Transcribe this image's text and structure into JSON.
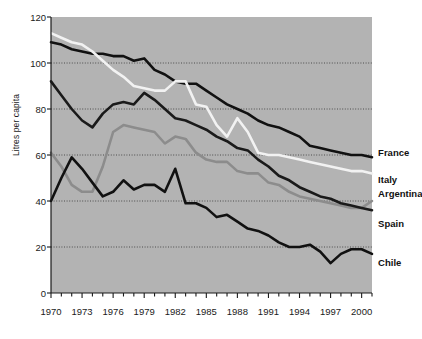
{
  "chart_data": {
    "type": "line",
    "title": "",
    "xlabel": "",
    "ylabel": "Litres per capita",
    "xlim": [
      1970,
      2001
    ],
    "ylim": [
      0,
      120
    ],
    "grid": true,
    "grid_values": [
      20,
      40,
      60,
      80,
      100
    ],
    "legend_position": "right-inline-labels",
    "plot_background": "#b3b3b3",
    "x": [
      1970,
      1971,
      1972,
      1973,
      1974,
      1975,
      1976,
      1977,
      1978,
      1979,
      1980,
      1981,
      1982,
      1983,
      1984,
      1985,
      1986,
      1987,
      1988,
      1989,
      1990,
      1991,
      1992,
      1993,
      1994,
      1995,
      1996,
      1997,
      1998,
      1999,
      2000,
      2001
    ],
    "xtick_labels": [
      "1970",
      "1973",
      "1976",
      "1979",
      "1982",
      "1985",
      "1988",
      "1991",
      "1994",
      "1997",
      "2000"
    ],
    "xtick_values": [
      1970,
      1973,
      1976,
      1979,
      1982,
      1985,
      1988,
      1991,
      1994,
      1997,
      2000
    ],
    "ytick_labels": [
      "0",
      "20",
      "40",
      "60",
      "80",
      "100",
      "120"
    ],
    "ytick_values": [
      0,
      20,
      40,
      60,
      80,
      100,
      120
    ],
    "series": [
      {
        "name": "France",
        "color": "#111111",
        "width": 2.6,
        "label_x": 2001.3,
        "label_y": 61,
        "values": [
          109,
          108,
          106,
          105,
          104,
          104,
          103,
          103,
          101,
          102,
          97,
          95,
          92,
          91,
          91,
          88,
          85,
          82,
          80,
          78,
          75,
          73,
          72,
          70,
          68,
          64,
          63,
          62,
          61,
          60,
          60,
          59
        ]
      },
      {
        "name": "Italy",
        "color": "#f2f2f2",
        "width": 2.6,
        "label_x": 2001.3,
        "label_y": 49,
        "values": [
          113,
          111,
          109,
          108,
          105,
          101,
          97,
          94,
          90,
          89,
          88,
          88,
          92,
          92,
          82,
          81,
          73,
          68,
          76,
          70,
          61,
          60,
          60,
          59,
          58,
          57,
          56,
          55,
          54,
          53,
          53,
          52
        ]
      },
      {
        "name": "Argentina",
        "color": "#8c8c8c",
        "width": 2.6,
        "label_x": 2001.3,
        "label_y": 43,
        "values": [
          61,
          55,
          47,
          44,
          44,
          55,
          70,
          73,
          72,
          71,
          70,
          65,
          68,
          67,
          61,
          58,
          57,
          57,
          53,
          52,
          52,
          48,
          47,
          44,
          42,
          41,
          40,
          39,
          38,
          37,
          37,
          40
        ]
      },
      {
        "name": "Spain",
        "color": "#1a1a1a",
        "width": 2.6,
        "label_x": 2001.3,
        "label_y": 30,
        "values": [
          92,
          86,
          80,
          75,
          72,
          78,
          82,
          83,
          82,
          87,
          84,
          80,
          76,
          75,
          73,
          71,
          68,
          66,
          63,
          62,
          58,
          55,
          51,
          49,
          46,
          44,
          42,
          41,
          39,
          38,
          37,
          36
        ]
      },
      {
        "name": "Chile",
        "color": "#111111",
        "width": 2.6,
        "label_x": 2001.3,
        "label_y": 13,
        "values": [
          40,
          50,
          59,
          54,
          48,
          42,
          44,
          49,
          45,
          47,
          47,
          44,
          54,
          39,
          39,
          37,
          33,
          34,
          31,
          28,
          27,
          25,
          22,
          20,
          20,
          21,
          18,
          13,
          17,
          19,
          19,
          17
        ]
      }
    ]
  }
}
